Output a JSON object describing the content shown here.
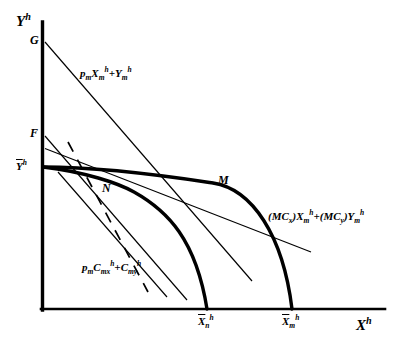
{
  "figure": {
    "type": "economics-diagram",
    "background_color": "#ffffff",
    "line_color": "#000000"
  },
  "axes": {
    "y_axis_label": "Y",
    "y_axis_superscript": "h",
    "x_axis_label": "X",
    "x_axis_superscript": "h",
    "origin_px": [
      41,
      310
    ],
    "x_axis_end_px": [
      385,
      310
    ],
    "y_axis_top_px": [
      41,
      22
    ]
  },
  "points": [
    {
      "id": "G",
      "label": "G",
      "px": [
        44,
        42
      ],
      "note": "intercept of market budget line on Y axis"
    },
    {
      "id": "F",
      "label": "F",
      "px": [
        44,
        135
      ],
      "note": "intercept of shadow-price lines on Y axis"
    },
    {
      "id": "Ybar",
      "label": "Y",
      "overline": true,
      "superscript": "h",
      "px": [
        44,
        167
      ],
      "note": "endowment of Y, vertical intercept of both frontiers"
    },
    {
      "id": "M",
      "label": "M",
      "px": [
        213,
        182
      ],
      "note": "tangency on outer frontier"
    },
    {
      "id": "N",
      "label": "N",
      "px": [
        130,
        192
      ],
      "note": "tangency on inner frontier"
    }
  ],
  "ticks": [
    {
      "id": "Xbar_n",
      "label": "X",
      "overline": true,
      "subscript": "n",
      "superscript": "h",
      "px": [
        207,
        310
      ]
    },
    {
      "id": "Xbar_m",
      "label": "X",
      "overline": true,
      "subscript": "m",
      "superscript": "h",
      "px": [
        292,
        310
      ]
    }
  ],
  "curves": [
    {
      "name": "outer-frontier",
      "style": "solid-thick",
      "from_px": [
        41,
        167
      ],
      "to_px": [
        292,
        310
      ],
      "control_px": [
        200,
        172
      ],
      "stroke_width": 3.2
    },
    {
      "name": "inner-frontier",
      "style": "solid-thick",
      "from_px": [
        41,
        167
      ],
      "to_px": [
        207,
        310
      ],
      "control_px": [
        135,
        180
      ],
      "stroke_width": 3.2
    }
  ],
  "lines": [
    {
      "name": "market-budget-line",
      "label_text": "p",
      "style": "solid-thin",
      "from_px": [
        44,
        42
      ],
      "to_px": [
        252,
        280
      ],
      "stroke_width": 1.1
    },
    {
      "name": "marginal-cost-line",
      "style": "solid-thin",
      "from_px": [
        44,
        149
      ],
      "to_px": [
        310,
        252
      ],
      "stroke_width": 1.1
    },
    {
      "name": "shadow-price-line-F-to-N",
      "style": "solid-thin",
      "from_px": [
        44,
        136
      ],
      "to_px": [
        186,
        299
      ],
      "stroke_width": 1.1
    },
    {
      "name": "consumption-budget-line",
      "style": "solid-thin",
      "from_px": [
        59,
        174
      ],
      "to_px": [
        166,
        296
      ],
      "stroke_width": 1.1
    },
    {
      "name": "dashed-indifference-line",
      "style": "dashed",
      "from_px": [
        68,
        143
      ],
      "to_px": [
        147,
        291
      ],
      "stroke_width": 1.6,
      "dash_pattern": "11 9"
    }
  ],
  "equation_labels": [
    {
      "id": "budget-market",
      "px": [
        80,
        72
      ],
      "parts": [
        {
          "t": "p",
          "style": "italic-bold"
        },
        {
          "t": "m",
          "style": "sub"
        },
        {
          "t": "X",
          "style": "italic-bold"
        },
        {
          "t": "m",
          "style": "sub"
        },
        {
          "t": "h",
          "style": "sup"
        },
        {
          "t": "+ ",
          "style": "plain"
        },
        {
          "t": "Y",
          "style": "italic-bold"
        },
        {
          "t": "m",
          "style": "sub"
        },
        {
          "t": "h",
          "style": "sup"
        }
      ],
      "plain_text": "p_m X_m^h + Y_m^h"
    },
    {
      "id": "marginal-cost",
      "px": [
        270,
        215
      ],
      "parts": [
        {
          "t": "(MC",
          "style": "italic-bold"
        },
        {
          "t": "x",
          "style": "sub"
        },
        {
          "t": ")X",
          "style": "italic-bold"
        },
        {
          "t": "m",
          "style": "sub"
        },
        {
          "t": "h",
          "style": "sup"
        },
        {
          "t": "+(MC",
          "style": "italic-bold"
        },
        {
          "t": "y",
          "style": "sub"
        },
        {
          "t": ")Y",
          "style": "italic-bold"
        },
        {
          "t": "m",
          "style": "sub"
        },
        {
          "t": "h",
          "style": "sup"
        }
      ],
      "plain_text": "(MC_x)X_m^h + (MC_y)Y_m^h"
    },
    {
      "id": "consumption",
      "px": [
        82,
        266
      ],
      "parts": [
        {
          "t": "p",
          "style": "italic-bold"
        },
        {
          "t": "m",
          "style": "sub"
        },
        {
          "t": "C",
          "style": "italic-bold"
        },
        {
          "t": "mx",
          "style": "sub"
        },
        {
          "t": "h",
          "style": "sup"
        },
        {
          "t": "+ ",
          "style": "plain"
        },
        {
          "t": "C",
          "style": "italic-bold"
        },
        {
          "t": "my",
          "style": "sub"
        },
        {
          "t": "h",
          "style": "sup"
        }
      ],
      "plain_text": "p_m C_mx^h + C_my^h"
    }
  ],
  "text": {
    "y_axis": "Y",
    "x_axis": "X",
    "sup_h": "h",
    "sub_m": "m",
    "sub_n": "n",
    "sub_x": "x",
    "sub_y": "y",
    "sub_mx": "mx",
    "sub_my": "my",
    "label_G": "G",
    "label_F": "F",
    "label_M": "M",
    "label_N": "N",
    "label_p": "p",
    "label_C": "C",
    "label_MC_open": "(MC",
    "label_paren_X": ")X",
    "label_plus_paren_MC": "+(MC",
    "label_paren_Y": ")Y",
    "plus": "+"
  }
}
